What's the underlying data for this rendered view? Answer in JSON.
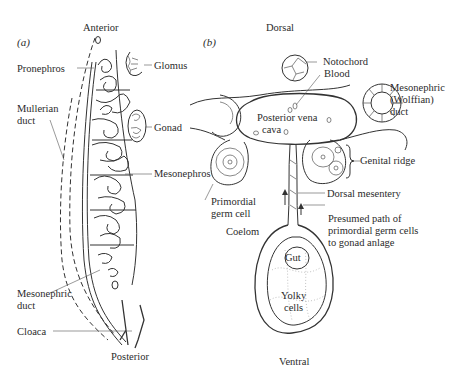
{
  "figure": {
    "panel_a": {
      "panel_label": "(a)",
      "orientation": {
        "top": "Anterior",
        "bottom": "Posterior"
      },
      "labels": {
        "pronephros": "Pronephros",
        "glomus": "Glomus",
        "mullerian_duct": "Mullerian\nduct",
        "gonad": "Gonad",
        "mesonephros": "Mesonephros",
        "mesonephric_duct": "Mesonephric\nduct",
        "cloaca": "Cloaca"
      }
    },
    "panel_b": {
      "panel_label": "(b)",
      "orientation": {
        "top": "Dorsal",
        "bottom": "Ventral"
      },
      "labels": {
        "notochord": "Notochord",
        "blood": "Blood",
        "mesonephric_wolffian_duct": "Mesonephric\n(Wolffian)\nduct",
        "posterior_vena": "Posterior vena",
        "cava": "cava",
        "genital_ridge": "Genital ridge",
        "primordial_germ_cell": "Primordial\ngerm cell",
        "dorsal_mesentery": "Dorsal mesentery",
        "coelom": "Coelom",
        "presumed_path": "Presumed path of\nprimordial germ cells\nto gonad anlage",
        "gut": "Gut",
        "yolky_cells": "Yolky\ncells"
      }
    }
  }
}
